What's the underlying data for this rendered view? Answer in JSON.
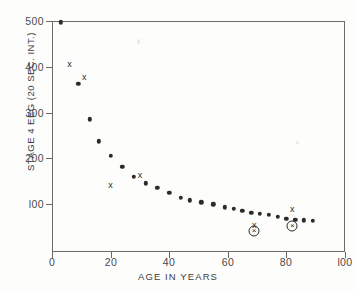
{
  "chart_data": {
    "type": "scatter",
    "title": "",
    "xlabel": "AGE IN YEARS",
    "ylabel": "STAGE 4 EEG (20 SEC. INT.)",
    "xlim": [
      0,
      100
    ],
    "ylim": [
      0,
      500
    ],
    "xticks": [
      0,
      20,
      40,
      60,
      80,
      100
    ],
    "xtick_labels": [
      "0",
      "20",
      "40",
      "60",
      "80",
      "l00"
    ],
    "yticks": [
      100,
      200,
      300,
      400,
      500
    ],
    "ytick_labels": [
      "l00",
      "200",
      "300",
      "400",
      "500"
    ],
    "grid": false,
    "legend": "none",
    "series": [
      {
        "name": "mean stage 4 EEG",
        "marker": "filled-circle",
        "points": [
          {
            "x": 3,
            "y": 497
          },
          {
            "x": 9,
            "y": 363
          },
          {
            "x": 13,
            "y": 285
          },
          {
            "x": 16,
            "y": 237
          },
          {
            "x": 20,
            "y": 205
          },
          {
            "x": 24,
            "y": 181
          },
          {
            "x": 28,
            "y": 160
          },
          {
            "x": 32,
            "y": 145
          },
          {
            "x": 36,
            "y": 136
          },
          {
            "x": 40,
            "y": 124
          },
          {
            "x": 44,
            "y": 113
          },
          {
            "x": 47,
            "y": 108
          },
          {
            "x": 51,
            "y": 104
          },
          {
            "x": 55,
            "y": 99
          },
          {
            "x": 59,
            "y": 93
          },
          {
            "x": 62,
            "y": 89
          },
          {
            "x": 65,
            "y": 85
          },
          {
            "x": 68,
            "y": 81
          },
          {
            "x": 71,
            "y": 78
          },
          {
            "x": 74,
            "y": 76
          },
          {
            "x": 77,
            "y": 72
          },
          {
            "x": 80,
            "y": 68
          },
          {
            "x": 83,
            "y": 66
          },
          {
            "x": 86,
            "y": 64
          },
          {
            "x": 89,
            "y": 63
          }
        ]
      },
      {
        "name": "individual X observations",
        "marker": "x",
        "points": [
          {
            "x": 6,
            "y": 406
          },
          {
            "x": 11,
            "y": 378
          },
          {
            "x": 20,
            "y": 141
          },
          {
            "x": 30,
            "y": 164
          },
          {
            "x": 69,
            "y": 55
          },
          {
            "x": 82,
            "y": 88
          }
        ]
      },
      {
        "name": "circled X observations",
        "marker": "circled-x",
        "points": [
          {
            "x": 69,
            "y": 42
          },
          {
            "x": 82,
            "y": 53
          }
        ]
      }
    ]
  },
  "figure": {
    "background_color": "#fdfdfc",
    "axis_color": "#6a6a6a",
    "marker_color": "#2b2b2b"
  }
}
